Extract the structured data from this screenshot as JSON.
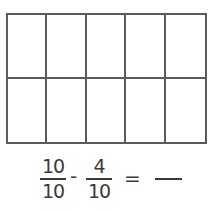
{
  "grid": {
    "rows": 2,
    "columns": 5,
    "total_cells": 10,
    "shaded_cells": 0,
    "line_color": "#5a5a5a"
  },
  "equation": {
    "fraction1": {
      "numerator": "10",
      "denominator": "10"
    },
    "operator": "-",
    "fraction2": {
      "numerator": "4",
      "denominator": "10"
    },
    "equals": "=",
    "answer": ""
  }
}
